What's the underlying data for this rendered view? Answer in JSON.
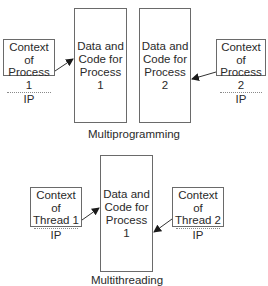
{
  "multiprogramming": {
    "caption": "Multiprogramming",
    "memory_boxes": [
      {
        "line1": "Data and",
        "line2": "Code for",
        "line3": "Process 1"
      },
      {
        "line1": "Data and",
        "line2": "Code for",
        "line3": "Process 2"
      }
    ],
    "contexts": [
      {
        "line1": "Context of",
        "line2": "Process 1",
        "register": "IP"
      },
      {
        "line1": "Context of",
        "line2": "Process 2",
        "register": "IP"
      }
    ]
  },
  "multithreading": {
    "caption": "Multithreading",
    "memory_box": {
      "line1": "Data and",
      "line2": "Code for",
      "line3": "Process 1"
    },
    "contexts": [
      {
        "line1": "Context of",
        "line2": "Thread 1",
        "register": "IP"
      },
      {
        "line1": "Context of",
        "line2": "Thread 2",
        "register": "IP"
      }
    ]
  },
  "colors": {
    "stroke": "#6a6a6a",
    "text": "#2a2a2a",
    "arrow": "#1a1a1a"
  }
}
